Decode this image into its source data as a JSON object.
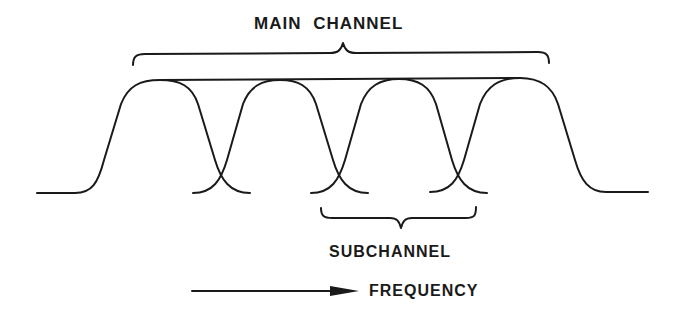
{
  "diagram": {
    "title": "MAIN CHANNEL",
    "subchannel_label": "SUBCHANNEL",
    "axis_label": "FREQUENCY",
    "subchannel_count": 4,
    "colors": {
      "stroke": "#1a1a1a",
      "background": "#ffffff"
    },
    "elements": {
      "main_brace": "spans all four subchannel passbands",
      "sub_brace": "spans one subchannel between adjacent crossover points",
      "arrow": "frequency increases to the right"
    }
  }
}
